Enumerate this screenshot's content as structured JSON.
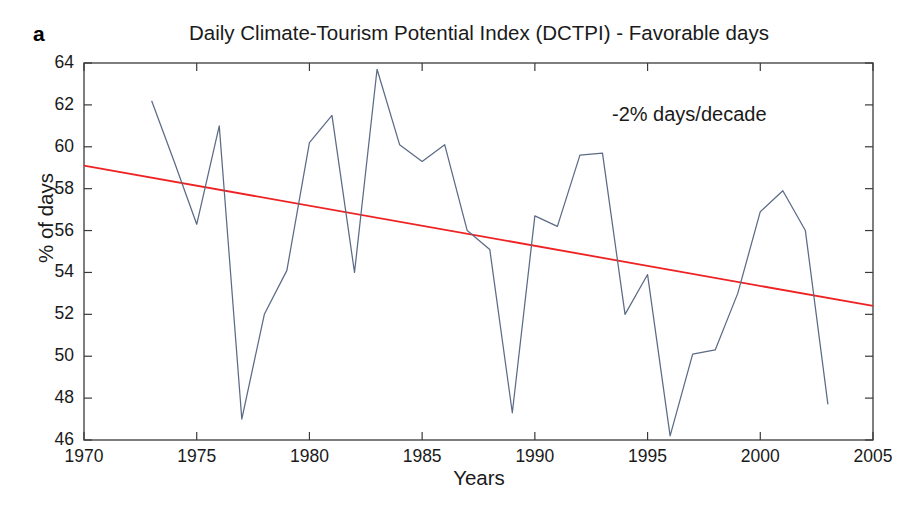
{
  "panel": {
    "letter": "a"
  },
  "annotations": {
    "trend_note": "-2% days/decade"
  },
  "chart_data": {
    "type": "line",
    "title": "Daily Climate-Tourism Potential Index (DCTPI) - Favorable days",
    "xlabel": "Years",
    "ylabel": "% of days",
    "xlim": [
      1970,
      2005
    ],
    "ylim": [
      46,
      64
    ],
    "xticks": [
      1970,
      1975,
      1980,
      1985,
      1990,
      1995,
      2000,
      2005
    ],
    "yticks": [
      46,
      48,
      50,
      52,
      54,
      56,
      58,
      60,
      62,
      64
    ],
    "grid": false,
    "legend": null,
    "series": [
      {
        "name": "DCTPI favorable days",
        "color": "#5b6b86",
        "x": [
          1973,
          1974,
          1975,
          1976,
          1977,
          1978,
          1979,
          1980,
          1981,
          1982,
          1983,
          1984,
          1985,
          1986,
          1987,
          1988,
          1989,
          1990,
          1991,
          1992,
          1993,
          1994,
          1995,
          1996,
          1997,
          1998,
          1999,
          2000,
          2001,
          2002,
          2003
        ],
        "values": [
          62.2,
          59.3,
          56.3,
          61.0,
          47.0,
          52.0,
          54.1,
          60.2,
          61.5,
          54.0,
          63.7,
          60.1,
          59.3,
          60.1,
          56.0,
          55.1,
          47.3,
          56.7,
          56.2,
          59.6,
          59.7,
          52.0,
          53.9,
          46.2,
          50.1,
          50.3,
          53.0,
          56.9,
          57.9,
          56.0,
          47.7
        ]
      },
      {
        "name": "linear trend",
        "color": "#ee2222",
        "type": "trend",
        "x": [
          1970,
          2005
        ],
        "values": [
          59.1,
          52.4
        ]
      }
    ]
  }
}
